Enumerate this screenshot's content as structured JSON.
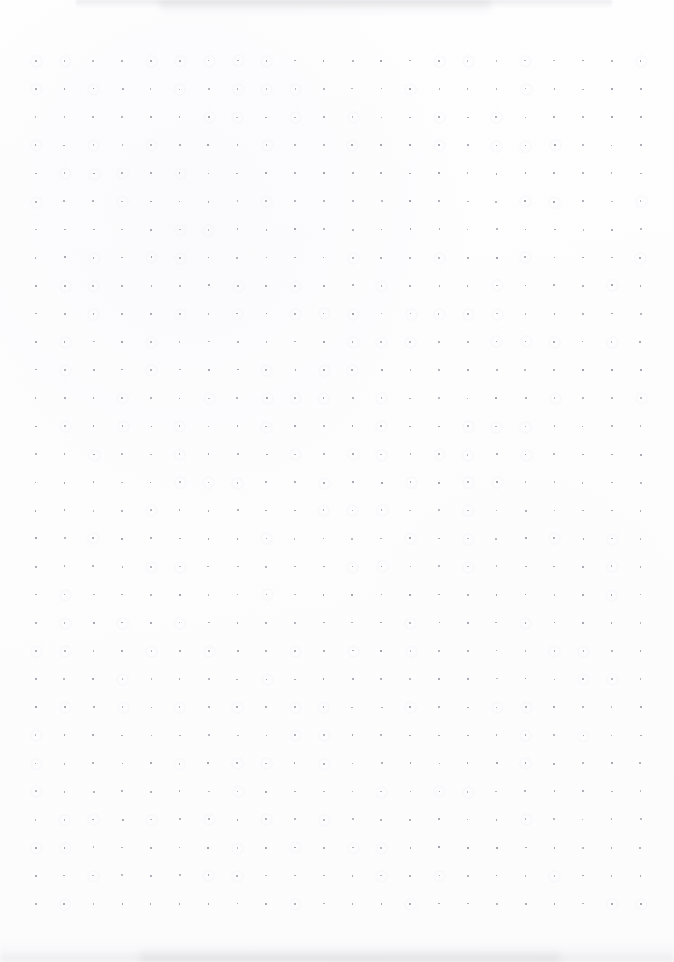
{
  "page": {
    "kind": "dot-grid-notebook-scan",
    "width": 674,
    "height": 962,
    "background_color": "#fdfdfe",
    "visible_text": "",
    "has_handwriting": false,
    "has_printed_text": false
  },
  "grid": {
    "dot_color": "#9a9aa6",
    "dot_size_px": 1.7,
    "spacing_x_px": 28.8,
    "spacing_y_px": 28.1,
    "origin_x_px": 35,
    "origin_y_px": 60,
    "columns": 22,
    "rows": 31,
    "opacity": 0.82
  },
  "artifacts": {
    "top_shadow": {
      "color": "#96969c",
      "left_px": 76,
      "width_px": 536,
      "height_px": 9
    },
    "bottom_shadow": {
      "color": "#c4c4ca",
      "left_px": 0,
      "width_px": 674,
      "height_px": 26
    }
  }
}
